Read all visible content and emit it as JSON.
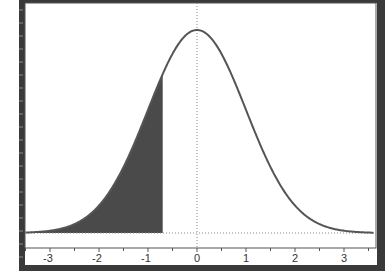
{
  "chart_data": {
    "type": "area",
    "title": "",
    "xlabel": "",
    "ylabel": "",
    "distribution": "standard normal",
    "mean": 0,
    "sd": 1,
    "xlim": [
      -3.5,
      3.6
    ],
    "x_ticks": [
      -3,
      -2,
      -1,
      0,
      1,
      2,
      3
    ],
    "x_tick_labels": [
      "-3",
      "-2",
      "-1",
      "0",
      "1",
      "2",
      "3"
    ],
    "shaded_region": {
      "from": -3.5,
      "to": -0.7,
      "description": "left tail shaded"
    },
    "reference_lines": [
      {
        "type": "vertical",
        "x": 0,
        "style": "dotted"
      },
      {
        "type": "horizontal",
        "y": 0,
        "style": "dotted"
      }
    ],
    "grid": false,
    "legend": null,
    "colors": {
      "curve": "#555555",
      "shade": "#4a4a4a",
      "frame": "#3a3a3a",
      "background": "#ffffff"
    }
  },
  "axis": {
    "labels": [
      "-3",
      "-2",
      "-1",
      "0",
      "1",
      "2",
      "3"
    ]
  }
}
